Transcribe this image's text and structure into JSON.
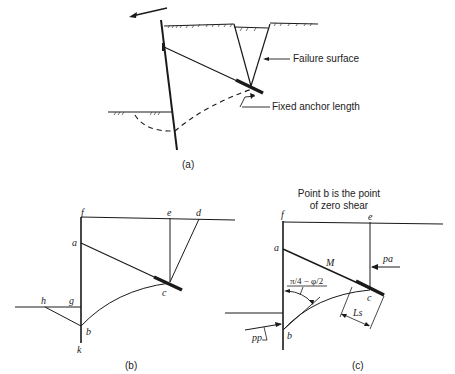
{
  "figure": {
    "panel_a": {
      "caption": "(a)",
      "labels": {
        "failure_surface": "Failure surface",
        "fixed_anchor_length": "Fixed anchor length"
      }
    },
    "panel_b": {
      "caption": "(b)",
      "points": {
        "f": "f",
        "e": "e",
        "d": "d",
        "a": "a",
        "c": "c",
        "h": "h",
        "g": "g",
        "b": "b",
        "k": "k"
      }
    },
    "panel_c": {
      "caption": "(c)",
      "note_line1": "Point b is the point",
      "note_line2": "of zero shear",
      "points": {
        "f": "f",
        "e": "e",
        "a": "a",
        "c": "c",
        "b": "b"
      },
      "labels": {
        "moment": "M",
        "angle": "π/4 − φ/2",
        "active_force": "pa",
        "passive_force": "pp",
        "anchor_length": "Ls"
      }
    }
  }
}
